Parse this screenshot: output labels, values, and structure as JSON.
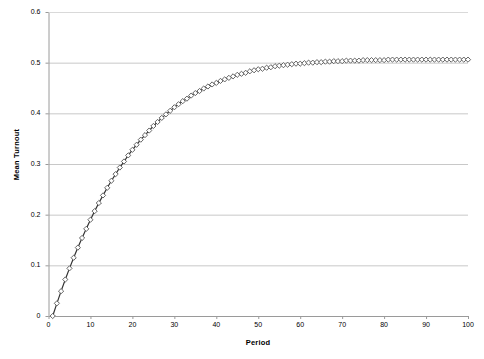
{
  "chart_data": {
    "type": "line",
    "title": "",
    "xlabel": "Period",
    "ylabel": "Mean Turnout",
    "xlim": [
      0,
      100
    ],
    "ylim": [
      0,
      0.6
    ],
    "xticks": [
      0,
      10,
      20,
      30,
      40,
      50,
      60,
      70,
      80,
      90,
      100
    ],
    "xtick_labels": [
      "0",
      "10",
      "20",
      "30",
      "40",
      "50",
      "60",
      "70",
      "80",
      "90",
      "100"
    ],
    "yticks": [
      0,
      0.1,
      0.2,
      0.3,
      0.4,
      0.5,
      0.6
    ],
    "ytick_labels": [
      "0",
      "0.1",
      "0.2",
      "0.3",
      "0.4",
      "0.5",
      "0.6"
    ],
    "grid": "horizontal",
    "legend": "none",
    "marker": "diamond",
    "marker_size": 2.6,
    "line_color": "#333333",
    "marker_color": "#555555",
    "gridline_color": "#c8c8c8",
    "axis_color": "#808080",
    "plot_background": "#ffffff",
    "series": [
      {
        "name": "Mean Turnout",
        "x": [
          1,
          2,
          3,
          4,
          5,
          6,
          7,
          8,
          9,
          10,
          11,
          12,
          13,
          14,
          15,
          16,
          17,
          18,
          19,
          20,
          21,
          22,
          23,
          24,
          25,
          26,
          27,
          28,
          29,
          30,
          31,
          32,
          33,
          34,
          35,
          36,
          37,
          38,
          39,
          40,
          41,
          42,
          43,
          44,
          45,
          46,
          47,
          48,
          49,
          50,
          51,
          52,
          53,
          54,
          55,
          56,
          57,
          58,
          59,
          60,
          61,
          62,
          63,
          64,
          65,
          66,
          67,
          68,
          69,
          70,
          71,
          72,
          73,
          74,
          75,
          76,
          77,
          78,
          79,
          80,
          81,
          82,
          83,
          84,
          85,
          86,
          87,
          88,
          89,
          90,
          91,
          92,
          93,
          94,
          95,
          96,
          97,
          98,
          99,
          100
        ],
        "y": [
          0.0,
          0.025,
          0.049,
          0.072,
          0.094,
          0.115,
          0.135,
          0.154,
          0.172,
          0.19,
          0.207,
          0.223,
          0.238,
          0.253,
          0.267,
          0.28,
          0.293,
          0.305,
          0.317,
          0.328,
          0.338,
          0.348,
          0.357,
          0.366,
          0.375,
          0.383,
          0.391,
          0.398,
          0.405,
          0.412,
          0.418,
          0.424,
          0.429,
          0.435,
          0.44,
          0.444,
          0.449,
          0.453,
          0.457,
          0.46,
          0.464,
          0.467,
          0.47,
          0.473,
          0.476,
          0.478,
          0.48,
          0.483,
          0.485,
          0.487,
          0.488,
          0.49,
          0.491,
          0.493,
          0.494,
          0.495,
          0.496,
          0.497,
          0.498,
          0.498,
          0.499,
          0.5,
          0.5,
          0.501,
          0.501,
          0.502,
          0.502,
          0.503,
          0.503,
          0.503,
          0.504,
          0.504,
          0.504,
          0.504,
          0.505,
          0.505,
          0.505,
          0.505,
          0.505,
          0.505,
          0.506,
          0.506,
          0.506,
          0.506,
          0.506,
          0.506,
          0.506,
          0.506,
          0.506,
          0.506,
          0.506,
          0.506,
          0.506,
          0.506,
          0.506,
          0.506,
          0.506,
          0.506,
          0.506,
          0.506
        ]
      }
    ]
  }
}
